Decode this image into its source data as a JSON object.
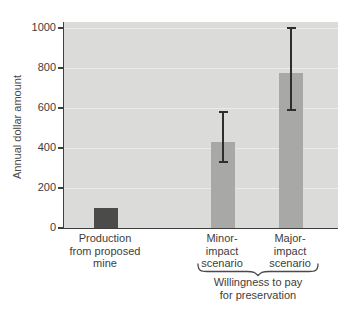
{
  "figure": {
    "background": "#ffffff",
    "plot_background": "#dbdbd9",
    "gridline_color": "#ebebe9",
    "axis_color": "#3f3f3e",
    "text_color": "#3d3d3d",
    "dark_bar_color": "#4b4b49",
    "light_bar_color": "#a8a8a6"
  },
  "chart_data": {
    "type": "bar",
    "title": "",
    "xlabel": "",
    "ylabel": "Annual dollar amount",
    "ylim": [
      0,
      1000
    ],
    "yticks": [
      0,
      200,
      400,
      600,
      800,
      1000
    ],
    "grid": true,
    "legend_position": "none",
    "categories": [
      "Production from proposed mine",
      "Minor-impact scenario",
      "Major-impact scenario"
    ],
    "category_label_lines": [
      [
        "Production",
        "from proposed",
        "mine"
      ],
      [
        "Minor-",
        "impact",
        "scenario"
      ],
      [
        "Major-",
        "impact",
        "scenario"
      ]
    ],
    "values": [
      100,
      430,
      775
    ],
    "bar_colors": [
      "#4b4b49",
      "#a8a8a6",
      "#a8a8a6"
    ],
    "error_bars": [
      null,
      {
        "low": 330,
        "high": 580
      },
      {
        "low": 590,
        "high": 1000
      }
    ],
    "group_annotation": {
      "label": "Willingness to pay for preservation",
      "label_lines": [
        "Willingness to pay",
        "for preservation"
      ],
      "covers": [
        "Minor-impact scenario",
        "Major-impact scenario"
      ]
    }
  }
}
